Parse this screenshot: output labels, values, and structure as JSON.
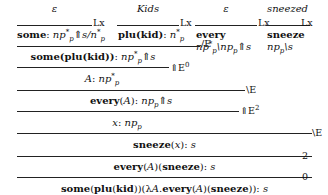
{
  "derivation": {
    "leaves": [
      {
        "premise": "ε",
        "rule": "Lx",
        "word": "some",
        "type": "np*p⇑s/n*p"
      },
      {
        "premise": "Kids",
        "rule": "Lx",
        "word": "plu(kid)",
        "type": "n*p"
      },
      {
        "premise": "ε",
        "rule": "Lx",
        "word": "every",
        "type": "np*p\\npp⇑s"
      },
      {
        "premise": "sneezed",
        "rule": "Lx",
        "word": "sneeze",
        "type": "npp\\s"
      }
    ],
    "steps": [
      {
        "term": "some(plu(kid))",
        "type": "np*p⇑s",
        "rule": "/E"
      },
      {
        "term": "A",
        "type": "np*p",
        "rule": "⇑E0"
      },
      {
        "term": "every(A)",
        "type": "npp⇑s",
        "rule": "\\E"
      },
      {
        "term": "x",
        "type": "npp",
        "rule": "⇑E2"
      },
      {
        "term": "sneeze(x)",
        "type": "s",
        "rule": "\\E"
      },
      {
        "term": "every(A)(sneeze)",
        "type": "s",
        "rule": "2"
      },
      {
        "term": "some(plu(kid))(λA.every(A)(sneeze))",
        "type": "s",
        "rule": "0"
      }
    ],
    "labels": {
      "lx": "Lx",
      "slashE": "/E",
      "upE0": "⇑E",
      "upE0_sup": "0",
      "bsE": "\\E",
      "upE2": "⇑E",
      "upE2_sup": "2",
      "two": "2",
      "zero": "0",
      "eps": "ε",
      "kids": "Kids",
      "sneezed": "sneezed"
    }
  }
}
